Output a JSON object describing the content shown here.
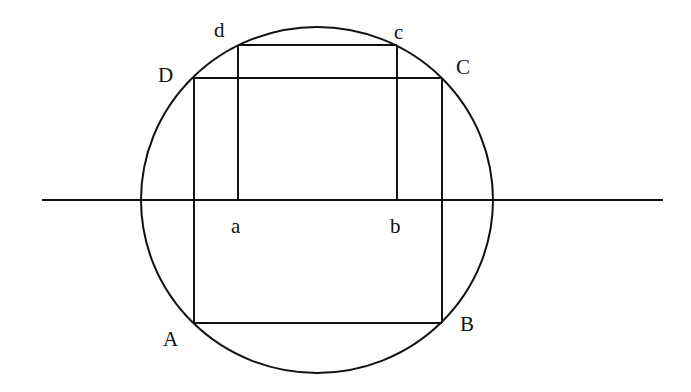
{
  "diagram": {
    "type": "geometry",
    "colors": {
      "stroke": "#111111",
      "background": "#ffffff"
    },
    "circle": {
      "cx": 317,
      "cy": 200,
      "rx": 176,
      "ry": 173
    },
    "axis_line": {
      "x1": 42,
      "y1": 200,
      "x2": 663,
      "y2": 200
    },
    "rect_ABCD": {
      "x_left": 194,
      "x_right": 442,
      "y_top": 78,
      "y_bottom": 323
    },
    "rect_abcd": {
      "x_left": 238,
      "x_right": 397,
      "y_top": 45,
      "y_bottom": 200
    },
    "labels": {
      "A": {
        "text": "A",
        "x": 163,
        "y": 346
      },
      "B": {
        "text": "B",
        "x": 460,
        "y": 331
      },
      "C": {
        "text": "C",
        "x": 456,
        "y": 74
      },
      "D": {
        "text": "D",
        "x": 158,
        "y": 82
      },
      "a": {
        "text": "a",
        "x": 231,
        "y": 233
      },
      "b": {
        "text": "b",
        "x": 390,
        "y": 233
      },
      "c": {
        "text": "c",
        "x": 394,
        "y": 39
      },
      "d": {
        "text": "d",
        "x": 214,
        "y": 37
      }
    }
  }
}
